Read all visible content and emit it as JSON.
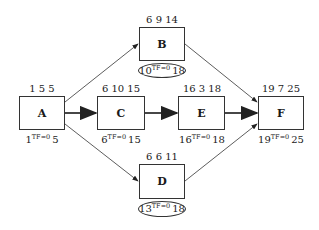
{
  "diagram": {
    "type": "activity-on-node network",
    "nodes": [
      {
        "id": "A",
        "label": "A",
        "top": "1 5 5",
        "es": "1",
        "tf": "TF=0",
        "lf": "5",
        "critical_circled": false
      },
      {
        "id": "B",
        "label": "B",
        "top": "6 9 14",
        "es": "10",
        "tf": "TF=0",
        "lf": "18",
        "critical_circled": true
      },
      {
        "id": "C",
        "label": "C",
        "top": "6 10 15",
        "es": "6",
        "tf": "TF=0",
        "lf": "15",
        "critical_circled": false
      },
      {
        "id": "D",
        "label": "D",
        "top": "6 6 11",
        "es": "13",
        "tf": "TF=0",
        "lf": "18",
        "critical_circled": true
      },
      {
        "id": "E",
        "label": "E",
        "top": "16 3 18",
        "es": "16",
        "tf": "TF=0",
        "lf": "18",
        "critical_circled": false
      },
      {
        "id": "F",
        "label": "F",
        "top": "19 7 25",
        "es": "19",
        "tf": "TF=0",
        "lf": "25",
        "critical_circled": false
      }
    ],
    "edges": [
      {
        "from": "A",
        "to": "B"
      },
      {
        "from": "A",
        "to": "C"
      },
      {
        "from": "A",
        "to": "D"
      },
      {
        "from": "C",
        "to": "E"
      },
      {
        "from": "B",
        "to": "F"
      },
      {
        "from": "E",
        "to": "F"
      },
      {
        "from": "D",
        "to": "F"
      }
    ]
  }
}
